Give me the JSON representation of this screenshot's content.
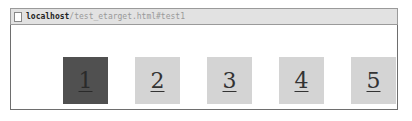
{
  "address_bar": {
    "host": "localhost",
    "path": "/test_etarget.html#test1"
  },
  "links": [
    {
      "label": "1",
      "active": true
    },
    {
      "label": "2",
      "active": false
    },
    {
      "label": "3",
      "active": false
    },
    {
      "label": "4",
      "active": false
    },
    {
      "label": "5",
      "active": false
    }
  ],
  "colors": {
    "active_bg": "#505050",
    "inactive_bg": "#d4d4d4"
  }
}
